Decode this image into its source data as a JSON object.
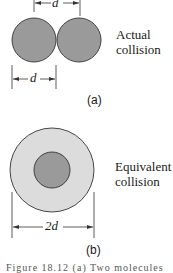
{
  "panel_a": {
    "label": "(a)",
    "description_line1": "Actual",
    "description_line2": "collision",
    "dim_top": "d",
    "dim_bottom": "d"
  },
  "panel_b": {
    "label": "(b)",
    "description_line1": "Equivalent",
    "description_line2": "collision",
    "dim_bottom": "2d"
  },
  "caption": "Figure 18.12   (a) Two molecules",
  "colors": {
    "molecule": "#9a9a9a",
    "outer_zone": "#dcdcdc",
    "stroke": "#333333"
  }
}
